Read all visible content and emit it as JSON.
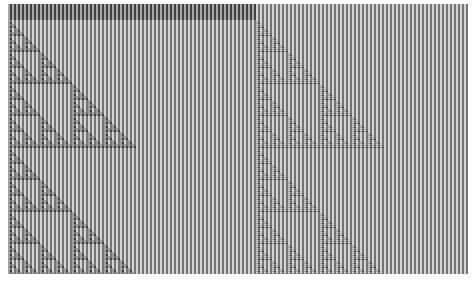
{
  "figure": {
    "kind": "elementary-cellular-automaton",
    "rule_description": "Sierpinski triangle (XOR / Pascal mod 2) overlaid on vertical stripes",
    "offset": {
      "x": 8,
      "y": 4
    },
    "size": {
      "width": 460,
      "height": 270
    },
    "cell_px": 2,
    "stripe_period_px": 4,
    "colors": {
      "background": "#ffffff",
      "stripe_light": "#cfcfcf",
      "stripe_dark": "#6f6f6f",
      "triangle_light": "#9a9a9a",
      "triangle_dark": "#3c3c3c",
      "top_band_light": "#a5a5a5"
    },
    "top_band": {
      "x_end": 248,
      "height": 16
    },
    "seed_columns_px": [
      0,
      247
    ],
    "sierpinski_period_rows": 128
  }
}
